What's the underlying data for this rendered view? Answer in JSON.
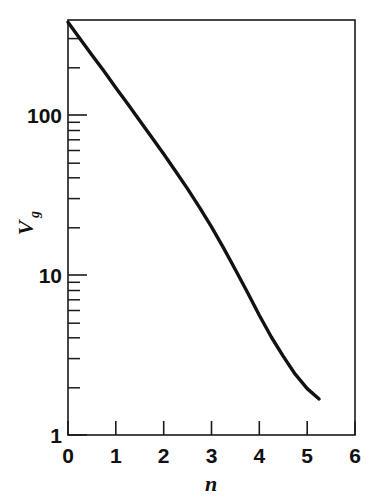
{
  "chart_data": {
    "type": "line",
    "title": "",
    "subtitle": "",
    "xlabel": "n",
    "ylabel": "Vg",
    "ylabel_base": "V",
    "ylabel_sub": "g",
    "xscale": "linear",
    "yscale": "log",
    "xlim": [
      0,
      6
    ],
    "ylim": [
      1,
      1000
    ],
    "grid": false,
    "legend": null,
    "annotations": [],
    "xticks": [
      0,
      1,
      2,
      3,
      4,
      5,
      6
    ],
    "xticklabels": [
      "0",
      "1",
      "2",
      "3",
      "4",
      "5",
      "6"
    ],
    "yticks": [
      1,
      10,
      100
    ],
    "yticklabels": [
      "1",
      "10",
      "100"
    ],
    "yminorticks": [
      2,
      3,
      4,
      5,
      6,
      7,
      8,
      9,
      20,
      30,
      40,
      50,
      60,
      70,
      80,
      90,
      200,
      300,
      400
    ],
    "series": [
      {
        "name": "Vg",
        "x": [
          0.0,
          0.25,
          0.5,
          0.75,
          1.0,
          1.25,
          1.5,
          1.75,
          2.0,
          2.25,
          2.5,
          2.75,
          3.0,
          3.25,
          3.5,
          3.75,
          4.0,
          4.25,
          4.5,
          4.75,
          5.0,
          5.25
        ],
        "y": [
          380.0,
          300.0,
          237.0,
          188.0,
          148.0,
          117.0,
          92.0,
          72.5,
          57.0,
          44.5,
          34.5,
          26.5,
          20.0,
          14.8,
          10.8,
          7.8,
          5.6,
          4.1,
          3.1,
          2.4,
          1.95,
          1.68
        ]
      }
    ],
    "line_color": "#121212",
    "frame_color": "#1a1a1a",
    "background_color": "#ffffff"
  },
  "labels": {
    "y_100": "100",
    "y_10": "10",
    "y_1": "1",
    "x_0": "0",
    "x_1": "1",
    "x_2": "2",
    "x_3": "3",
    "x_4": "4",
    "x_5": "5",
    "x_6": "6",
    "xaxis_title": "n",
    "yaxis_title_base": "V",
    "yaxis_title_sub": "g"
  }
}
